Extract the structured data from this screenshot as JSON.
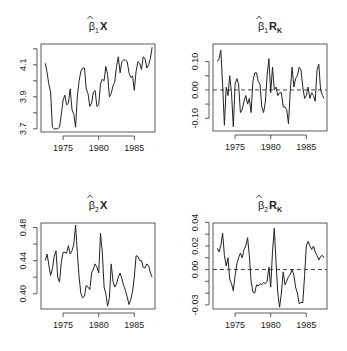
{
  "chart_data": [
    {
      "type": "line",
      "title": "β̂1X",
      "title_parts": {
        "hat": "β",
        "sub": "1",
        "bold": "X",
        "bold_sub": ""
      },
      "xlabel": "",
      "ylabel": "",
      "xlim": [
        1971.9,
        1987.9
      ],
      "ylim": [
        3.68,
        4.23
      ],
      "xticks": [
        1975,
        1980,
        1985
      ],
      "yticks": [
        3.7,
        3.8,
        3.9,
        4.0,
        4.1,
        4.2
      ],
      "ytick_labels": [
        "3.7",
        "",
        "3.9",
        "",
        "4.1",
        ""
      ],
      "hline": null,
      "box": {
        "x": 41,
        "y": 44,
        "w": 114,
        "h": 88
      },
      "x": [
        1972.5,
        1972.75,
        1973,
        1973.25,
        1973.5,
        1973.75,
        1974,
        1974.25,
        1974.5,
        1974.75,
        1975,
        1975.25,
        1975.5,
        1975.75,
        1976,
        1976.25,
        1976.5,
        1976.75,
        1977,
        1977.25,
        1977.5,
        1977.75,
        1978,
        1978.25,
        1978.5,
        1978.75,
        1979,
        1979.25,
        1979.5,
        1979.75,
        1980,
        1980.25,
        1980.5,
        1980.75,
        1981,
        1981.25,
        1981.5,
        1981.75,
        1982,
        1982.25,
        1982.5,
        1982.75,
        1983,
        1983.25,
        1983.5,
        1983.75,
        1984,
        1984.25,
        1984.5,
        1984.75,
        1985,
        1985.25,
        1985.5,
        1985.75,
        1986,
        1986.25,
        1986.5,
        1986.75,
        1987,
        1987.25,
        1987.5
      ],
      "values": [
        4.11,
        4.05,
        3.98,
        3.93,
        3.71,
        3.7,
        3.7,
        3.7,
        3.71,
        3.79,
        3.88,
        3.91,
        3.85,
        3.86,
        3.95,
        3.82,
        3.79,
        3.71,
        3.9,
        4.0,
        4.06,
        4.08,
        4.08,
        3.95,
        3.92,
        3.84,
        3.86,
        3.93,
        3.94,
        3.84,
        3.85,
        3.98,
        4.01,
        4.0,
        4.09,
        4.04,
        3.9,
        3.92,
        3.97,
        3.99,
        4.09,
        4.15,
        4.05,
        4.12,
        4.13,
        4.13,
        4.12,
        4.05,
        4.02,
        4.03,
        3.94,
        4.06,
        4.12,
        4.11,
        4.07,
        4.15,
        4.14,
        4.08,
        4.1,
        4.14,
        4.21
      ],
      "series": [
        {
          "name": "β̂1X"
        }
      ]
    },
    {
      "type": "line",
      "title": "β̂1RK",
      "title_parts": {
        "hat": "β",
        "sub": "1",
        "bold": "R",
        "bold_sub": "K"
      },
      "xlabel": "",
      "ylabel": "",
      "xlim": [
        1971.9,
        1987.9
      ],
      "ylim": [
        -0.145,
        0.162
      ],
      "xticks": [
        1975,
        1980,
        1985
      ],
      "yticks": [
        -0.1,
        -0.05,
        0.0,
        0.05,
        0.1
      ],
      "ytick_labels": [
        "-0.10",
        "",
        "0.00",
        "",
        "0.10"
      ],
      "hline": 0.0,
      "box": {
        "x": 213,
        "y": 44,
        "w": 114,
        "h": 87
      },
      "x": [
        1972.5,
        1972.75,
        1973,
        1973.25,
        1973.5,
        1973.75,
        1974,
        1974.25,
        1974.5,
        1974.75,
        1975,
        1975.25,
        1975.5,
        1975.75,
        1976,
        1976.25,
        1976.5,
        1976.75,
        1977,
        1977.25,
        1977.5,
        1977.75,
        1978,
        1978.25,
        1978.5,
        1978.75,
        1979,
        1979.25,
        1979.5,
        1979.75,
        1980,
        1980.25,
        1980.5,
        1980.75,
        1981,
        1981.25,
        1981.5,
        1981.75,
        1982,
        1982.25,
        1982.5,
        1982.75,
        1983,
        1983.25,
        1983.5,
        1983.75,
        1984,
        1984.25,
        1984.5,
        1984.75,
        1985,
        1985.25,
        1985.5,
        1985.75,
        1986,
        1986.25,
        1986.5,
        1986.75,
        1987,
        1987.25,
        1987.5
      ],
      "values": [
        0.1,
        0.11,
        0.14,
        0.02,
        -0.125,
        0.01,
        -0.02,
        0.05,
        -0.01,
        -0.13,
        0.02,
        0.04,
        0.02,
        -0.08,
        -0.07,
        -0.04,
        -0.02,
        -0.05,
        -0.03,
        -0.08,
        0.03,
        0.06,
        0.06,
        0.03,
        0.02,
        -0.06,
        -0.08,
        -0.04,
        0.05,
        0.11,
        -0.01,
        0.08,
        0.0,
        0.01,
        -0.02,
        -0.01,
        -0.01,
        -0.06,
        -0.06,
        -0.07,
        -0.12,
        0.0,
        0.08,
        0.01,
        0.04,
        0.05,
        0.08,
        0.07,
        0.01,
        -0.03,
        -0.02,
        0.01,
        -0.03,
        -0.01,
        -0.02,
        -0.04,
        0.07,
        0.09,
        0.0,
        -0.02,
        -0.03
      ],
      "series": [
        {
          "name": "β̂1RK"
        }
      ]
    },
    {
      "type": "line",
      "title": "β̂2X",
      "title_parts": {
        "hat": "β",
        "sub": "2",
        "bold": "X",
        "bold_sub": ""
      },
      "xlabel": "",
      "ylabel": "",
      "xlim": [
        1971.9,
        1987.9
      ],
      "ylim": [
        0.3815,
        0.4855
      ],
      "xticks": [
        1975,
        1980,
        1985
      ],
      "yticks": [
        0.4,
        0.42,
        0.44,
        0.46,
        0.48
      ],
      "ytick_labels": [
        "0.40",
        "",
        "0.44",
        "",
        "0.48"
      ],
      "hline": null,
      "box": {
        "x": 41,
        "y": 223,
        "w": 114,
        "h": 86
      },
      "x": [
        1972.5,
        1972.75,
        1973,
        1973.25,
        1973.5,
        1973.75,
        1974,
        1974.25,
        1974.5,
        1974.75,
        1975,
        1975.25,
        1975.5,
        1975.75,
        1976,
        1976.25,
        1976.5,
        1976.75,
        1977,
        1977.25,
        1977.5,
        1977.75,
        1978,
        1978.25,
        1978.5,
        1978.75,
        1979,
        1979.25,
        1979.5,
        1979.75,
        1980,
        1980.25,
        1980.5,
        1980.75,
        1981,
        1981.25,
        1981.5,
        1981.75,
        1982,
        1982.25,
        1982.5,
        1982.75,
        1983,
        1983.25,
        1983.5,
        1983.75,
        1984,
        1984.25,
        1984.5,
        1984.75,
        1985,
        1985.25,
        1985.5,
        1985.75,
        1986,
        1986.25,
        1986.5,
        1986.75,
        1987,
        1987.25,
        1987.5
      ],
      "values": [
        0.44,
        0.448,
        0.435,
        0.422,
        0.43,
        0.445,
        0.452,
        0.42,
        0.414,
        0.438,
        0.45,
        0.45,
        0.449,
        0.458,
        0.448,
        0.452,
        0.46,
        0.483,
        0.45,
        0.42,
        0.4,
        0.395,
        0.397,
        0.41,
        0.408,
        0.405,
        0.425,
        0.43,
        0.436,
        0.432,
        0.425,
        0.473,
        0.45,
        0.408,
        0.4,
        0.385,
        0.395,
        0.436,
        0.415,
        0.408,
        0.412,
        0.42,
        0.425,
        0.418,
        0.41,
        0.404,
        0.396,
        0.387,
        0.393,
        0.403,
        0.42,
        0.446,
        0.445,
        0.44,
        0.44,
        0.432,
        0.431,
        0.436,
        0.434,
        0.425,
        0.42
      ],
      "series": [
        {
          "name": "β̂2X"
        }
      ]
    },
    {
      "type": "line",
      "title": "β̂2RK",
      "title_parts": {
        "hat": "β",
        "sub": "2",
        "bold": "R",
        "bold_sub": "K"
      },
      "xlabel": "",
      "ylabel": "",
      "xlim": [
        1971.9,
        1987.9
      ],
      "ylim": [
        -0.0335,
        0.0395
      ],
      "xticks": [
        1975,
        1980,
        1985
      ],
      "yticks": [
        -0.03,
        -0.02,
        -0.01,
        0.0,
        0.01,
        0.02,
        0.03,
        0.04
      ],
      "ytick_labels": [
        "-0.03",
        "",
        "",
        "0.00",
        "",
        "0.02",
        "",
        "0.04"
      ],
      "hline": 0.0,
      "box": {
        "x": 213,
        "y": 223,
        "w": 114,
        "h": 86
      },
      "x": [
        1972.5,
        1972.75,
        1973,
        1973.25,
        1973.5,
        1973.75,
        1974,
        1974.25,
        1974.5,
        1974.75,
        1975,
        1975.25,
        1975.5,
        1975.75,
        1976,
        1976.25,
        1976.5,
        1976.75,
        1977,
        1977.25,
        1977.5,
        1977.75,
        1978,
        1978.25,
        1978.5,
        1978.75,
        1979,
        1979.25,
        1979.5,
        1979.75,
        1980,
        1980.25,
        1980.5,
        1980.75,
        1981,
        1981.25,
        1981.5,
        1981.75,
        1982,
        1982.25,
        1982.5,
        1982.75,
        1983,
        1983.25,
        1983.5,
        1983.75,
        1984,
        1984.25,
        1984.5,
        1984.75,
        1985,
        1985.25,
        1985.5,
        1985.75,
        1986,
        1986.25,
        1986.5,
        1986.75,
        1987,
        1987.25,
        1987.5
      ],
      "values": [
        0.018,
        0.015,
        0.02,
        0.031,
        0.012,
        0.003,
        0.01,
        -0.008,
        -0.012,
        -0.018,
        -0.005,
        0.005,
        0.01,
        0.014,
        0.01,
        0.017,
        0.02,
        0.027,
        0.012,
        -0.01,
        -0.019,
        -0.02,
        -0.013,
        -0.014,
        -0.012,
        -0.013,
        -0.011,
        -0.012,
        -0.01,
        0.002,
        -0.015,
        0.015,
        0.035,
        0.005,
        -0.02,
        -0.032,
        -0.02,
        -0.002,
        -0.013,
        -0.01,
        -0.006,
        -0.004,
        0.0,
        -0.005,
        -0.015,
        -0.02,
        -0.029,
        -0.028,
        -0.028,
        -0.005,
        0.02,
        0.024,
        0.02,
        0.017,
        0.02,
        0.015,
        0.012,
        0.008,
        0.011,
        0.012,
        0.01
      ],
      "series": [
        {
          "name": "β̂2RK"
        }
      ]
    }
  ]
}
